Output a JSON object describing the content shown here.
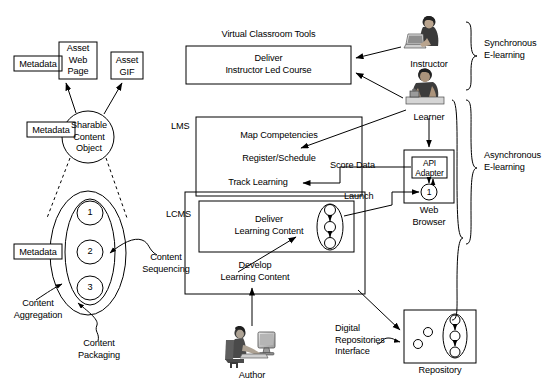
{
  "diagram": {
    "stroke_color": "#000000",
    "fill_color": "#ffffff"
  },
  "content_model": {
    "metadata_label_1": "Metadata",
    "metadata_label_2": "Metadata",
    "metadata_label_3": "Metadata",
    "asset_web_page": "Asset\nWeb\nPage",
    "asset_gif": "Asset\nGIF",
    "sharable_content_object": "Sharable\nContent\nObject",
    "aggregation_items": [
      "1",
      "2",
      "3"
    ],
    "content_sequencing": "Content\nSequencing",
    "content_aggregation": "Content\nAggregation",
    "content_packaging": "Content\nPackaging"
  },
  "virtual_classroom": {
    "caption": "Virtual Classroom Tools",
    "body": "Deliver\nInstructor Led Course"
  },
  "lms": {
    "label": "LMS",
    "items": [
      "Map Competencies",
      "Register/Schedule",
      "Track Learning"
    ]
  },
  "lcms": {
    "label": "LCMS",
    "deliver": "Deliver\nLearning Content",
    "develop": "Develop\nLearning Content"
  },
  "actors": {
    "instructor": "Instructor",
    "learner": "Learner",
    "author": "Author"
  },
  "browser": {
    "api_adapter": "API\nAdapter",
    "sco_number": "1",
    "caption": "Web\nBrowser"
  },
  "repository": {
    "caption": "Repository",
    "interface_label": "Digital\nRepositories\nInterface"
  },
  "flows": {
    "score_data": "Score Data",
    "launch": "Launch"
  },
  "brackets": {
    "synchronous": "Synchronous\nE-learning",
    "asynchronous": "Asynchronous\nE-learning"
  }
}
